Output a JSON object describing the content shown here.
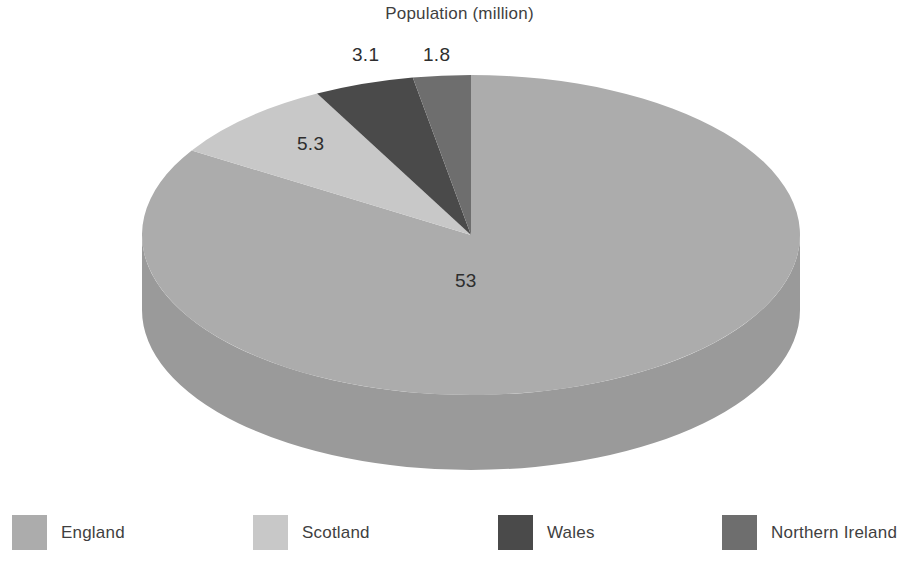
{
  "chart_data": {
    "type": "pie",
    "title": "Population (million)",
    "xlabel": "",
    "ylabel": "",
    "style": "3d-pie",
    "legend_position": "bottom",
    "grid": false,
    "unit": "million",
    "total": 63.2,
    "categories": [
      "England",
      "Scotland",
      "Wales",
      "Northern Ireland"
    ],
    "values": [
      53,
      5.3,
      3.1,
      1.8
    ],
    "data_labels": [
      "53",
      "5.3",
      "3.1",
      "1.8"
    ],
    "slices": [
      {
        "name": "England",
        "value": 53,
        "label": "53",
        "percent": 83.9,
        "start_angle": 0,
        "sweep_angle": 301.9,
        "color": "#ACACAC",
        "side_color": "#9A9A9A"
      },
      {
        "name": "Scotland",
        "value": 5.3,
        "label": "5.3",
        "percent": 8.4,
        "start_angle": 301.9,
        "sweep_angle": 30.2,
        "color": "#C8C8C8",
        "side_color": "#B4B4B4"
      },
      {
        "name": "Wales",
        "value": 3.1,
        "label": "3.1",
        "percent": 4.9,
        "start_angle": 332.1,
        "sweep_angle": 17.7,
        "color": "#4A4A4A",
        "side_color": "#3C3C3C"
      },
      {
        "name": "Northern Ireland",
        "value": 1.8,
        "label": "1.8",
        "percent": 2.8,
        "start_angle": 349.8,
        "sweep_angle": 10.2,
        "color": "#6E6E6E",
        "side_color": "#5C5C5C"
      }
    ]
  },
  "title": {
    "text": "Population (million)"
  },
  "labels": {
    "england": "53",
    "scotland": "5.3",
    "wales": "3.1",
    "northern_ireland": "1.8"
  },
  "legend": {
    "items": [
      {
        "label": "England",
        "color": "#ACACAC"
      },
      {
        "label": "Scotland",
        "color": "#C8C8C8"
      },
      {
        "label": "Wales",
        "color": "#4A4A4A"
      },
      {
        "label": "Northern Ireland",
        "color": "#6E6E6E"
      }
    ]
  },
  "colors": {
    "background": "#FFFFFF",
    "text": "#3F3F3F",
    "england": "#ACACAC",
    "scotland": "#C8C8C8",
    "wales": "#4A4A4A",
    "northern_ireland": "#6E6E6E"
  }
}
